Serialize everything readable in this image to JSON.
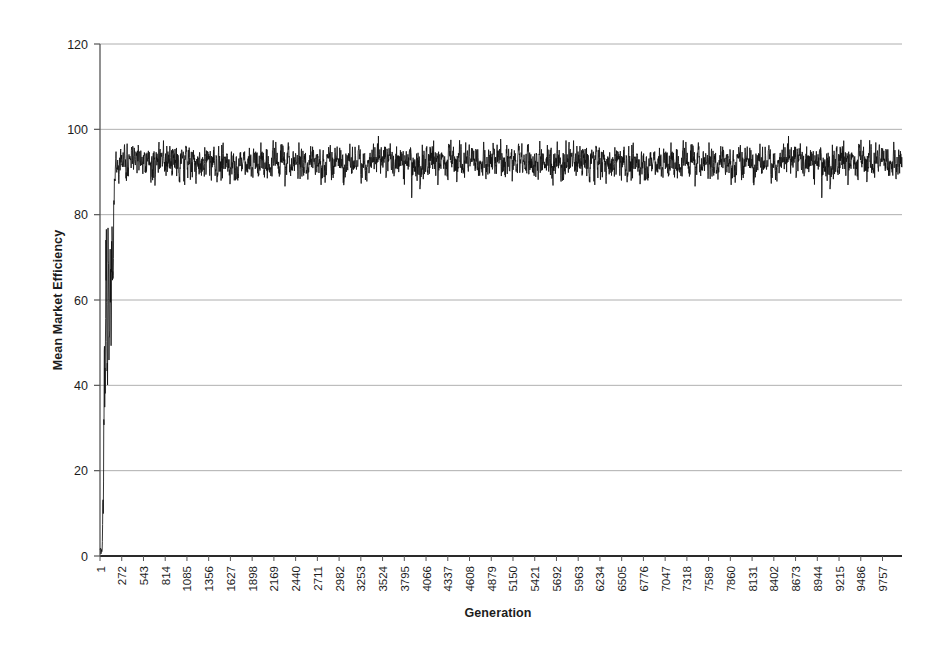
{
  "chart_data": {
    "type": "line",
    "title": "",
    "xlabel": "Generation",
    "ylabel": "Mean Market Efficiency",
    "xlim": [
      1,
      10000
    ],
    "ylim": [
      0,
      120
    ],
    "grid": true,
    "legend": false,
    "series_color": "#111111",
    "grid_color": "#9a9a9a",
    "axis_color": "#555555",
    "yticks": [
      0,
      20,
      40,
      60,
      80,
      100,
      120
    ],
    "ytick_labels": [
      "0",
      "20",
      "40",
      "60",
      "80",
      "100",
      "120"
    ],
    "xticks": [
      1,
      272,
      543,
      814,
      1085,
      1356,
      1627,
      1898,
      2169,
      2440,
      2711,
      2982,
      3253,
      3524,
      3795,
      4066,
      4337,
      4608,
      4879,
      5150,
      5421,
      5692,
      5963,
      6234,
      6505,
      6776,
      7047,
      7318,
      7589,
      7860,
      8131,
      8402,
      8673,
      8944,
      9215,
      9486,
      9757
    ],
    "xtick_labels": [
      "1",
      "272",
      "543",
      "814",
      "1085",
      "1356",
      "1627",
      "1898",
      "2169",
      "2440",
      "2711",
      "2982",
      "3253",
      "3524",
      "3795",
      "4066",
      "4337",
      "4608",
      "4879",
      "5150",
      "5421",
      "5692",
      "5963",
      "6234",
      "6505",
      "6776",
      "7047",
      "7318",
      "7589",
      "7860",
      "8131",
      "8402",
      "8673",
      "8944",
      "9215",
      "9486",
      "9757"
    ],
    "series": [
      {
        "name": "Mean Market Efficiency",
        "description": "Noisy time series: starts near 0 at generation 1, rises sharply with a spike to about 82 around generation 60, oscillates between about 40 and 85 until roughly generation 170, then settles into a high plateau band oscillating mostly between about 88 and 99 for the remainder of the run, with occasional downward spikes to about 83-86.",
        "phases": [
          {
            "from": 1,
            "to": 30,
            "low": 0,
            "high": 3,
            "note": "near-zero start"
          },
          {
            "from": 30,
            "to": 70,
            "low": 38,
            "high": 82,
            "note": "sharp rise with first spike"
          },
          {
            "from": 70,
            "to": 120,
            "low": 40,
            "high": 72,
            "note": "deep dip and recovery"
          },
          {
            "from": 120,
            "to": 175,
            "low": 62,
            "high": 88,
            "note": "second climb"
          },
          {
            "from": 175,
            "to": 10000,
            "low": 86,
            "high": 99,
            "note": "high noisy plateau"
          }
        ],
        "plateau_mean": 94.5,
        "plateau_min": 83,
        "plateau_max": 99.2
      }
    ]
  },
  "figure": {
    "background_color": "#ffffff"
  }
}
